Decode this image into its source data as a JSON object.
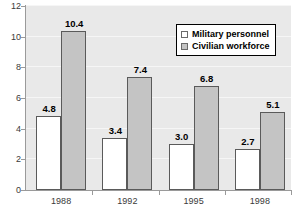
{
  "chart_data": {
    "type": "bar",
    "title": "",
    "subtitle": "",
    "xlabel": "",
    "ylabel": "",
    "categories": [
      "1988",
      "1992",
      "1995",
      "1998"
    ],
    "series": [
      {
        "name": "Military personnel",
        "color": "#ffffff",
        "values": [
          4.8,
          3.4,
          3.0,
          2.7
        ],
        "labels": [
          "4.8",
          "3.4",
          "3.0",
          "2.7"
        ]
      },
      {
        "name": "Civilian workforce",
        "color": "#c4c4c4",
        "values": [
          10.4,
          7.4,
          6.8,
          5.1
        ],
        "labels": [
          "10.4",
          "7.4",
          "6.8",
          "5.1"
        ]
      }
    ],
    "ylim": [
      0,
      12
    ],
    "ytick_values": [
      0,
      2,
      4,
      6,
      8,
      10,
      12
    ],
    "ytick_labels": [
      "0",
      "2",
      "4",
      "6",
      "8",
      "10",
      "12"
    ],
    "grid": true,
    "grid_axis": "y",
    "legend_position": "upper right",
    "plot_background": "#e9e9e9",
    "axis_color": "#9a9a9a",
    "bar_edge_color": "#5a5a5a",
    "data_labels_shown": true
  },
  "legend": {
    "entries": [
      {
        "label": "Military personnel",
        "swatch": "#ffffff"
      },
      {
        "label": "Civilian workforce",
        "swatch": "#c4c4c4"
      }
    ]
  }
}
